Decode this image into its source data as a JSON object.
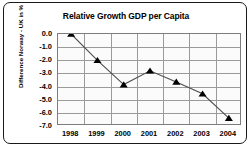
{
  "chart_data": {
    "type": "line",
    "title": "Relative Growth GDP per Capita",
    "xlabel": "",
    "ylabel": "Difference Norway - UK in %",
    "x": [
      "1998",
      "1999",
      "2000",
      "2001",
      "2002",
      "2003",
      "2004"
    ],
    "categories": [
      "1998",
      "1999",
      "2000",
      "2001",
      "2002",
      "2003",
      "2004"
    ],
    "values": [
      0.0,
      -2.0,
      -3.85,
      -2.8,
      -3.65,
      -4.55,
      -6.4
    ],
    "series": [
      {
        "name": "Difference Norway - UK in %",
        "values": [
          0.0,
          -2.0,
          -3.85,
          -2.8,
          -3.65,
          -4.55,
          -6.4
        ]
      }
    ],
    "ylim": [
      -7.0,
      0.0
    ],
    "ytick_labels": [
      "0.0",
      "-1.0",
      "-2.0",
      "-3.0",
      "-4.0",
      "-5.0",
      "-6.0",
      "-7.0"
    ],
    "ytick_values": [
      0.0,
      -1.0,
      -2.0,
      -3.0,
      -4.0,
      -5.0,
      -6.0,
      -7.0
    ],
    "xtick_labels": [
      "1998",
      "1999",
      "2000",
      "2001",
      "2002",
      "2003",
      "2004"
    ],
    "grid": true,
    "grid_axis": "both",
    "legend": false,
    "legend_position": "none",
    "marker": "triangle",
    "marker_color": "#000000",
    "line_color": "#4d4d4d",
    "plot_background": "#fbfbfb",
    "grid_color": "#9a9a9a",
    "frame_color": "#1a1a1a",
    "annotations": []
  }
}
